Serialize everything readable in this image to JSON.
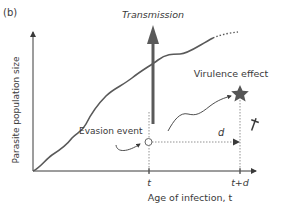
{
  "panel_label": "(b)",
  "annotations": {
    "transmission": "Transmission",
    "virulence_effect": "Virulence effect",
    "evasion_event": "Evasion event",
    "delay": "d"
  },
  "axes": {
    "ylabel": "Parasite population size",
    "xlabel": "Age of infection, t",
    "xticks": [
      "t",
      "t+d"
    ]
  },
  "colors": {
    "curve": "#595959",
    "axis": "#3a3a3a",
    "arrow": "#5a5a5a",
    "star": "#555555",
    "dashed": "#777777"
  }
}
